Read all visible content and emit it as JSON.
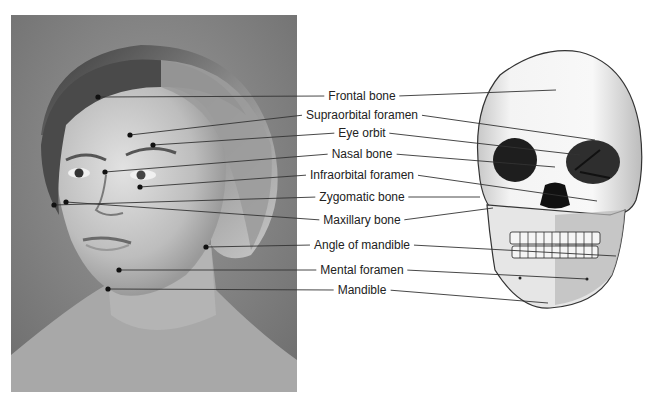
{
  "figure": {
    "left_panel": "Photograph of woman's face with surface landmarks",
    "right_panel": "Drawing of anterior skull"
  },
  "labels": [
    {
      "text": "Frontal bone",
      "x": 362,
      "y": 96,
      "face": [
        98,
        97
      ],
      "skull": [
        556,
        90
      ]
    },
    {
      "text": "Supraorbital foramen",
      "x": 362,
      "y": 115,
      "face": [
        130,
        135
      ],
      "skull": [
        595,
        140
      ]
    },
    {
      "text": "Eye orbit",
      "x": 362,
      "y": 133,
      "face": [
        153,
        145
      ],
      "skull": [
        580,
        155
      ]
    },
    {
      "text": "Nasal bone",
      "x": 362,
      "y": 154,
      "face": [
        105,
        172
      ],
      "skull": [
        555,
        167
      ]
    },
    {
      "text": "Infraorbital foramen",
      "x": 362,
      "y": 175,
      "face": [
        140,
        187
      ],
      "skull": [
        597,
        201
      ]
    },
    {
      "text": "Zygomatic bone",
      "x": 362,
      "y": 197,
      "face": [
        54,
        205
      ],
      "skull": [
        480,
        197
      ]
    },
    {
      "text": "Maxillary bone",
      "x": 362,
      "y": 220,
      "face": [
        66,
        202
      ],
      "skull": [
        493,
        208
      ]
    },
    {
      "text": "Angle of mandible",
      "x": 362,
      "y": 245,
      "face": [
        206,
        247
      ],
      "skull": [
        616,
        256
      ]
    },
    {
      "text": "Mental foramen",
      "x": 362,
      "y": 270,
      "face": [
        119,
        270
      ],
      "skull": [
        587,
        279
      ]
    },
    {
      "text": "Mandible",
      "x": 362,
      "y": 290,
      "face": [
        108,
        289
      ],
      "skull": [
        548,
        303
      ]
    }
  ],
  "colors": {
    "leader_line": "#333333",
    "dot": "#111111",
    "label_text": "#222222",
    "photo_bg": "#8a8a8a"
  }
}
